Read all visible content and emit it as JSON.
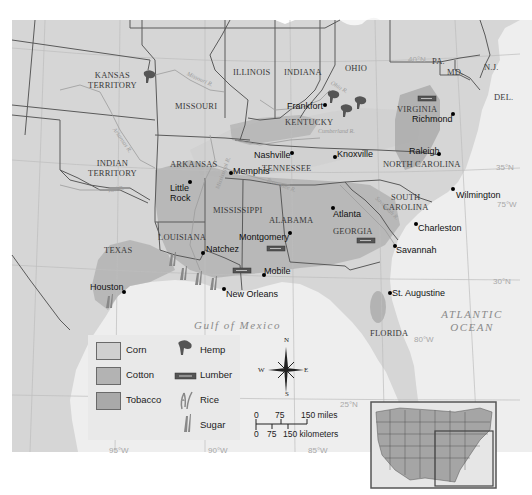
{
  "map": {
    "colors": {
      "land": "#d6d6d6",
      "water": "#eeeeee",
      "corn": "#d0d0d0",
      "cotton": "#b3b3b3",
      "tobacco": "#a9a9a9",
      "border": "#5a5a5a",
      "grid": "#bdbdbd"
    },
    "states": [
      {
        "id": "kansas-territory",
        "label": "KANSAS\nTERRITORY"
      },
      {
        "id": "missouri",
        "label": "MISSOURI"
      },
      {
        "id": "illinois",
        "label": "ILLINOIS"
      },
      {
        "id": "indiana",
        "label": "INDIANA"
      },
      {
        "id": "ohio",
        "label": "OHIO"
      },
      {
        "id": "pa",
        "label": "PA."
      },
      {
        "id": "nj",
        "label": "N.J."
      },
      {
        "id": "md",
        "label": "MD."
      },
      {
        "id": "del",
        "label": "DEL."
      },
      {
        "id": "virginia",
        "label": "VIRGINIA"
      },
      {
        "id": "kentucky",
        "label": "KENTUCKY"
      },
      {
        "id": "indian-territory",
        "label": "INDIAN\nTERRITORY"
      },
      {
        "id": "arkansas",
        "label": "ARKANSAS"
      },
      {
        "id": "tennessee",
        "label": "TENNESSEE"
      },
      {
        "id": "north-carolina",
        "label": "NORTH CAROLINA"
      },
      {
        "id": "south-carolina",
        "label": "SOUTH\nCAROLINA"
      },
      {
        "id": "mississippi",
        "label": "MISSISSIPPI"
      },
      {
        "id": "alabama",
        "label": "ALABAMA"
      },
      {
        "id": "georgia",
        "label": "GEORGIA"
      },
      {
        "id": "louisiana",
        "label": "LOUISIANA"
      },
      {
        "id": "texas",
        "label": "TEXAS"
      },
      {
        "id": "florida",
        "label": "FLORIDA"
      }
    ],
    "cities": [
      {
        "id": "frankfort",
        "label": "Frankfort"
      },
      {
        "id": "richmond",
        "label": "Richmond"
      },
      {
        "id": "nashville",
        "label": "Nashville"
      },
      {
        "id": "knoxville",
        "label": "Knoxville"
      },
      {
        "id": "raleigh",
        "label": "Raleigh"
      },
      {
        "id": "memphis",
        "label": "Memphis"
      },
      {
        "id": "little-rock",
        "label": "Little\nRock"
      },
      {
        "id": "wilmington",
        "label": "Wilmington"
      },
      {
        "id": "atlanta",
        "label": "Atlanta"
      },
      {
        "id": "charleston",
        "label": "Charleston"
      },
      {
        "id": "montgomery",
        "label": "Montgomery"
      },
      {
        "id": "savannah",
        "label": "Savannah"
      },
      {
        "id": "natchez",
        "label": "Natchez"
      },
      {
        "id": "mobile",
        "label": "Mobile"
      },
      {
        "id": "houston",
        "label": "Houston"
      },
      {
        "id": "new-orleans",
        "label": "New Orleans"
      },
      {
        "id": "st-augustine",
        "label": "St. Augustine"
      }
    ],
    "water_bodies": {
      "gulf": "Gulf of Mexico",
      "atlantic_line1": "ATLANTIC",
      "atlantic_line2": "OCEAN"
    },
    "rivers": {
      "missouri": "Missouri R.",
      "arkansas": "Arkansas R.",
      "red": "Red R.",
      "mississippi": "Mississippi R.",
      "ohio": "Ohio R.",
      "cumberland": "Cumberland R.",
      "tennessee": "Tennessee R.",
      "savannah": "Savannah R."
    },
    "grid_labels": {
      "lat40": "40°N",
      "lat35": "35°N",
      "lat30": "30°N",
      "lat25": "25°N",
      "lon75": "75°W",
      "lon80": "80°W",
      "lon85": "85°W",
      "lon90": "90°W",
      "lon95": "95°W"
    }
  },
  "legend": {
    "regions": [
      {
        "label": "Corn",
        "color": "#d0d0d0"
      },
      {
        "label": "Cotton",
        "color": "#b3b3b3"
      },
      {
        "label": "Tobacco",
        "color": "#a9a9a9"
      }
    ],
    "symbols": [
      {
        "label": "Hemp",
        "icon": "hemp-icon"
      },
      {
        "label": "Lumber",
        "icon": "lumber-icon"
      },
      {
        "label": "Rice",
        "icon": "rice-icon"
      },
      {
        "label": "Sugar",
        "icon": "sugar-icon"
      }
    ]
  },
  "compass": {
    "n": "N",
    "s": "S",
    "e": "E",
    "w": "W"
  },
  "scale": {
    "miles_ticks": [
      "0",
      "75",
      "150 miles"
    ],
    "km_ticks": [
      "0",
      "75",
      "150 kilometers"
    ]
  }
}
